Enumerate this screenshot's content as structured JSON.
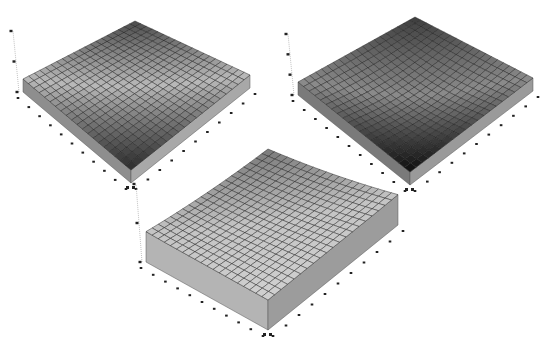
{
  "chart_data": [
    {
      "type": "surface3d",
      "id": "plot-top-left",
      "title": "",
      "grid": 20,
      "shape": "flat-tilted",
      "description": "Nearly flat surface slab; lighter in center band, darkening toward front corner",
      "corners": {
        "top": [
          135,
          21
        ],
        "left": [
          23,
          79
        ],
        "right": [
          250,
          75
        ],
        "bottom": [
          131,
          170
        ]
      },
      "thickness": 13,
      "heights": {
        "back": 0,
        "left": 0,
        "right": 0,
        "front": 0,
        "curve": 0.0
      },
      "shade": {
        "back": "#4a4a4a",
        "mid": "#b8b8b8",
        "front": "#2a2a2a"
      },
      "side_left": "#8e8e8e",
      "side_right": "#a8a8a8",
      "z_ticks": 3,
      "x_ticks": 10,
      "y_ticks": 10
    },
    {
      "type": "surface3d",
      "id": "plot-top-right",
      "title": "",
      "grid": 20,
      "shape": "saddle-low-center",
      "description": "Surface curving down from back-left and right, darkest near front",
      "corners": {
        "top": [
          415,
          17
        ],
        "left": [
          298,
          82
        ],
        "right": [
          533,
          78
        ],
        "bottom": [
          410,
          172
        ]
      },
      "thickness": 13,
      "heights": {
        "back": 0,
        "left": 0,
        "right": 0,
        "front": 0,
        "curve": 8
      },
      "shade": {
        "back": "#3c3c3c",
        "mid": "#8a8a8a",
        "front": "#0e0e0e"
      },
      "side_left": "#7a7a7a",
      "side_right": "#9a9a9a",
      "z_ticks": 4,
      "x_ticks": 10,
      "y_ticks": 10
    },
    {
      "type": "surface3d",
      "id": "plot-bottom",
      "title": "",
      "grid": 20,
      "shape": "rising-to-back",
      "description": "Surface rising concavely toward the back corner; tall front slab",
      "corners": {
        "top": [
          268,
          163
        ],
        "left": [
          146,
          232
        ],
        "right": [
          398,
          195
        ],
        "bottom": [
          268,
          300
        ]
      },
      "thickness": 30,
      "heights": {
        "back": 0,
        "left": 0,
        "right": 0,
        "front": 0,
        "curve": -14
      },
      "shade": {
        "back": "#7a7a7a",
        "mid": "#c4c4c4",
        "front": "#d0d0d0"
      },
      "side_left": "#b4b4b4",
      "side_right": "#9c9c9c",
      "z_ticks": 3,
      "x_ticks": 10,
      "y_ticks": 10
    }
  ]
}
